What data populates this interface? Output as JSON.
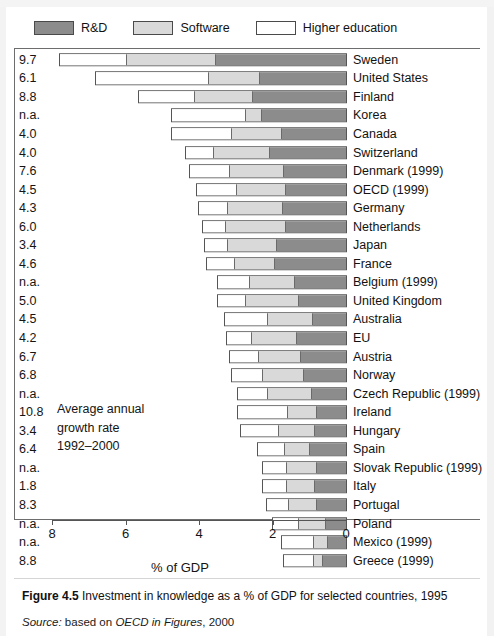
{
  "legend": {
    "items": [
      {
        "label": "R&D",
        "color": "#8c8c8c",
        "key": "rd"
      },
      {
        "label": "Software",
        "color": "#d9d9d9",
        "key": "software"
      },
      {
        "label": "Higher education",
        "color": "#ffffff",
        "key": "higher"
      }
    ]
  },
  "annotation": {
    "line1": "Average annual",
    "line2": "growth rate",
    "line3": "1992–2000"
  },
  "axis": {
    "title": "% of GDP",
    "ticks": [
      "8",
      "6",
      "4",
      "2",
      "0"
    ],
    "tick_values": [
      8,
      6,
      4,
      2,
      0
    ],
    "min": 0,
    "max": 8,
    "reversed": true
  },
  "caption": {
    "figure_number": "Figure 4.5",
    "figure_text": "Investment in knowledge as a % of GDP for selected countries, 1995",
    "source_keyword": "Source:",
    "source_prefix": "based on",
    "source_work": "OECD in Figures",
    "source_year": ", 2000"
  },
  "chart_data": {
    "type": "bar",
    "orientation": "horizontal-stacked",
    "title": "Investment in knowledge as a % of GDP for selected countries, 1995",
    "xlabel": "% of GDP",
    "ylabel": "",
    "xlim": [
      0,
      8
    ],
    "x_axis_reversed": true,
    "grid": false,
    "legend_position": "top-left",
    "series": [
      {
        "name": "Higher education",
        "color": "#ffffff"
      },
      {
        "name": "Software",
        "color": "#d9d9d9"
      },
      {
        "name": "R&D",
        "color": "#8c8c8c"
      }
    ],
    "categories": [
      "Sweden",
      "United States",
      "Finland",
      "Korea",
      "Canada",
      "Switzerland",
      "Denmark (1999)",
      "OECD (1999)",
      "Germany",
      "Netherlands",
      "Japan",
      "France",
      "Belgium (1999)",
      "United Kingdom",
      "Australia",
      "EU",
      "Austria",
      "Norway",
      "Czech Republic (1999)",
      "Ireland",
      "Hungary",
      "Spain",
      "Slovak Republic (1999)",
      "Italy",
      "Portugal",
      "Poland",
      "Mexico (1999)",
      "Greece (1999)"
    ],
    "growth_rates": [
      "9.7",
      "6.1",
      "8.8",
      "n.a.",
      "4.0",
      "4.0",
      "7.6",
      "4.5",
      "4.3",
      "6.0",
      "3.4",
      "4.6",
      "n.a.",
      "5.0",
      "4.5",
      "4.2",
      "6.7",
      "6.8",
      "n.a.",
      "10.8",
      "3.4",
      "6.4",
      "n.a.",
      "1.8",
      "8.3",
      "n.a.",
      "n.a.",
      "8.8"
    ],
    "rows": [
      {
        "country": "Sweden",
        "growth": "9.7",
        "higher": 1.85,
        "software": 2.45,
        "rd": 3.55,
        "total": 7.85
      },
      {
        "country": "United States",
        "growth": "6.1",
        "higher": 3.1,
        "software": 1.4,
        "rd": 2.35,
        "total": 6.85
      },
      {
        "country": "Finland",
        "growth": "8.8",
        "higher": 1.55,
        "software": 1.6,
        "rd": 2.55,
        "total": 5.7
      },
      {
        "country": "Korea",
        "growth": "n.a.",
        "higher": 2.05,
        "software": 0.45,
        "rd": 2.3,
        "total": 4.8
      },
      {
        "country": "Canada",
        "growth": "4.0",
        "higher": 1.65,
        "software": 1.4,
        "rd": 1.75,
        "total": 4.8
      },
      {
        "country": "Switzerland",
        "growth": "4.0",
        "higher": 0.75,
        "software": 1.55,
        "rd": 2.1,
        "total": 4.4
      },
      {
        "country": "Denmark (1999)",
        "growth": "7.6",
        "higher": 1.1,
        "software": 1.5,
        "rd": 1.7,
        "total": 4.3
      },
      {
        "country": "OECD (1999)",
        "growth": "4.5",
        "higher": 1.1,
        "software": 1.35,
        "rd": 1.65,
        "total": 4.1
      },
      {
        "country": "Germany",
        "growth": "4.3",
        "higher": 0.8,
        "software": 1.5,
        "rd": 1.75,
        "total": 4.05
      },
      {
        "country": "Netherlands",
        "growth": "6.0",
        "higher": 0.65,
        "software": 1.65,
        "rd": 1.65,
        "total": 3.95
      },
      {
        "country": "Japan",
        "growth": "3.4",
        "higher": 0.65,
        "software": 1.35,
        "rd": 1.9,
        "total": 3.9
      },
      {
        "country": "France",
        "growth": "4.6",
        "higher": 0.8,
        "software": 1.1,
        "rd": 1.95,
        "total": 3.85
      },
      {
        "country": "Belgium (1999)",
        "growth": "n.a.",
        "higher": 0.9,
        "software": 1.25,
        "rd": 1.4,
        "total": 3.55
      },
      {
        "country": "United Kingdom",
        "growth": "5.0",
        "higher": 0.8,
        "software": 1.45,
        "rd": 1.3,
        "total": 3.55
      },
      {
        "country": "Australia",
        "growth": "4.5",
        "higher": 1.2,
        "software": 1.25,
        "rd": 0.9,
        "total": 3.35
      },
      {
        "country": "EU",
        "growth": "4.2",
        "higher": 0.7,
        "software": 1.25,
        "rd": 1.35,
        "total": 3.3
      },
      {
        "country": "Austria",
        "growth": "6.7",
        "higher": 0.8,
        "software": 1.15,
        "rd": 1.25,
        "total": 3.2
      },
      {
        "country": "Norway",
        "growth": "6.8",
        "higher": 0.85,
        "software": 1.15,
        "rd": 1.15,
        "total": 3.15
      },
      {
        "country": "Czech Republic (1999)",
        "growth": "n.a.",
        "higher": 0.85,
        "software": 1.2,
        "rd": 0.95,
        "total": 3.0
      },
      {
        "country": "Ireland",
        "growth": "10.8",
        "higher": 1.4,
        "software": 0.8,
        "rd": 0.8,
        "total": 3.0
      },
      {
        "country": "Hungary",
        "growth": "3.4",
        "higher": 1.05,
        "software": 1.0,
        "rd": 0.85,
        "total": 2.9
      },
      {
        "country": "Spain",
        "growth": "6.4",
        "higher": 0.75,
        "software": 0.7,
        "rd": 1.0,
        "total": 2.45
      },
      {
        "country": "Slovak Republic (1999)",
        "growth": "n.a.",
        "higher": 0.65,
        "software": 0.85,
        "rd": 0.8,
        "total": 2.3
      },
      {
        "country": "Italy",
        "growth": "1.8",
        "higher": 0.65,
        "software": 0.8,
        "rd": 0.85,
        "total": 2.3
      },
      {
        "country": "Portugal",
        "growth": "8.3",
        "higher": 0.6,
        "software": 0.8,
        "rd": 0.8,
        "total": 2.2
      },
      {
        "country": "Poland",
        "growth": "n.a.",
        "higher": 0.75,
        "software": 0.75,
        "rd": 0.55,
        "total": 2.05
      },
      {
        "country": "Mexico (1999)",
        "growth": "n.a.",
        "higher": 0.9,
        "software": 0.4,
        "rd": 0.5,
        "total": 1.8
      },
      {
        "country": "Greece (1999)",
        "growth": "8.8",
        "higher": 0.85,
        "software": 0.25,
        "rd": 0.65,
        "total": 1.75
      }
    ]
  }
}
